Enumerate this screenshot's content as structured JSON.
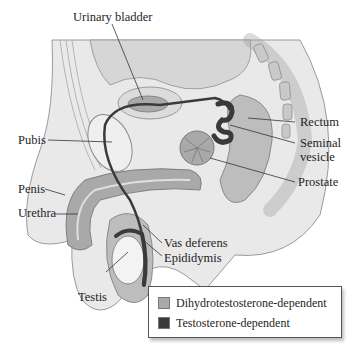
{
  "figure": {
    "type": "anatomical-diagram"
  },
  "labels": {
    "urinary_bladder": "Urinary bladder",
    "pubis": "Pubis",
    "penis": "Penis",
    "urethra": "Urethra",
    "rectum": "Rectum",
    "seminal_vesicle_1": "Seminal",
    "seminal_vesicle_2": "vesicle",
    "prostate": "Prostate",
    "vas_deferens": "Vas deferens",
    "epididymis": "Epididymis",
    "testis": "Testis"
  },
  "legend": {
    "items": [
      {
        "label": "Dihydrotestosterone-dependent",
        "color": "#a9a9a9"
      },
      {
        "label": "Testosterone-dependent",
        "color": "#3a3a3a"
      }
    ]
  },
  "colors": {
    "tissue_light": "#e6e6e6",
    "tissue_mid": "#cfcfcf",
    "dht_gray": "#a9a9a9",
    "testo_dark": "#3a3a3a",
    "outline": "#8a8a8a"
  }
}
